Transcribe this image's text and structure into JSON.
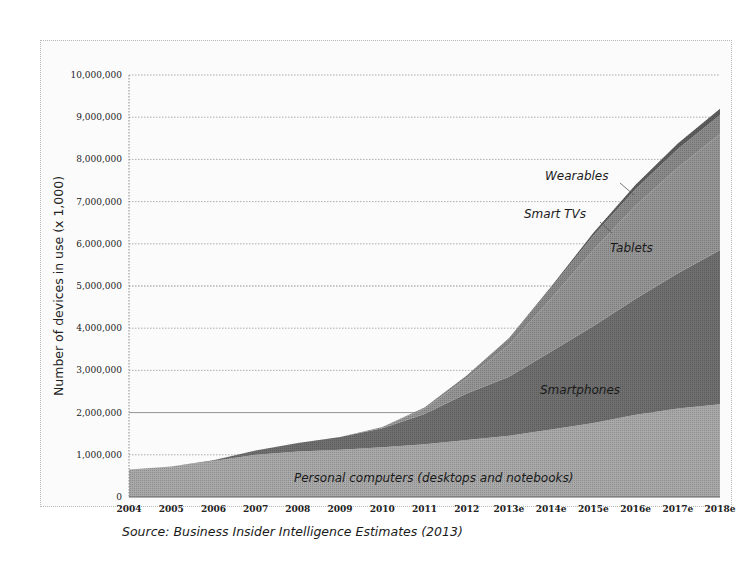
{
  "chart_data": {
    "type": "area",
    "stacked": true,
    "title": "",
    "xlabel": "",
    "ylabel": "Number of devices in use (x 1,000)",
    "ylim": [
      0,
      10000000
    ],
    "yticks": [
      "0",
      "1,000,000",
      "2,000,000",
      "3,000,000",
      "4,000,000",
      "5,000,000",
      "6,000,000",
      "7,000,000",
      "8,000,000",
      "9,000,000",
      "10,000,000"
    ],
    "categories": [
      "2004",
      "2005",
      "2006",
      "2007",
      "2008",
      "2009",
      "2010",
      "2011",
      "2012",
      "2013e",
      "2014e",
      "2015e",
      "2016e",
      "2017e",
      "2018e"
    ],
    "series": [
      {
        "name": "Personal computers (desktops and notebooks)",
        "color": "#a9a9a9",
        "values": [
          650000,
          720000,
          850000,
          1000000,
          1080000,
          1120000,
          1180000,
          1250000,
          1350000,
          1450000,
          1600000,
          1750000,
          1950000,
          2100000,
          2200000
        ]
      },
      {
        "name": "Smartphones",
        "color": "#6f6f6f",
        "values": [
          0,
          0,
          20000,
          100000,
          200000,
          300000,
          450000,
          720000,
          1100000,
          1400000,
          1850000,
          2300000,
          2750000,
          3200000,
          3650000
        ]
      },
      {
        "name": "Tablets",
        "color": "#959595",
        "values": [
          0,
          0,
          0,
          0,
          0,
          0,
          30000,
          120000,
          350000,
          750000,
          1250000,
          1800000,
          2200000,
          2500000,
          2750000
        ]
      },
      {
        "name": "Smart TVs",
        "color": "#8a8a8a",
        "values": [
          0,
          0,
          0,
          0,
          0,
          0,
          0,
          30000,
          80000,
          150000,
          250000,
          350000,
          400000,
          450000,
          450000
        ]
      },
      {
        "name": "Wearables",
        "color": "#5e5e5e",
        "values": [
          0,
          0,
          0,
          0,
          0,
          0,
          0,
          0,
          0,
          10000,
          30000,
          60000,
          100000,
          130000,
          150000
        ]
      }
    ],
    "annotations": [
      "Wearables",
      "Smart TVs",
      "Tablets",
      "Smartphones",
      "Personal computers (desktops and notebooks)"
    ],
    "grid": "horizontal dotted",
    "legend": "inline labels",
    "source": "Source: Business Insider Intelligence Estimates (2013)"
  },
  "labels": {
    "wearables": "Wearables",
    "smart_tvs": "Smart TVs",
    "tablets": "Tablets",
    "smartphones": "Smartphones",
    "pcs": "Personal computers (desktops and notebooks)",
    "ylabel": "Number of devices in use (x 1,000)",
    "source": "Source: Business Insider Intelligence Estimates (2013)"
  }
}
